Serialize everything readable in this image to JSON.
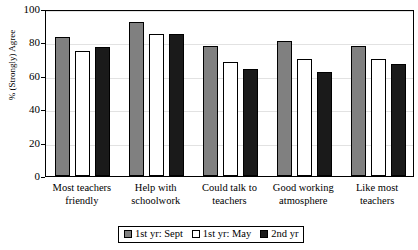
{
  "chart_data": {
    "type": "bar",
    "title": "",
    "xlabel": "",
    "ylabel": "% (Strongly) Agree",
    "ylim": [
      0,
      100
    ],
    "yticks": [
      0,
      20,
      40,
      60,
      80,
      100
    ],
    "ytick_labels": [
      "0",
      "20",
      "40",
      "60",
      "80",
      "100"
    ],
    "grid": true,
    "legend_position": "bottom",
    "categories": [
      "Most teachers friendly",
      "Help with schoolwork",
      "Could talk to teachers",
      "Good working atmosphere",
      "Like most teachers"
    ],
    "category_lines": [
      [
        "Most teachers",
        "friendly"
      ],
      [
        "Help with",
        "schoolwork"
      ],
      [
        "Could talk to",
        "teachers"
      ],
      [
        "Good working",
        "atmosphere"
      ],
      [
        "Like most",
        "teachers"
      ]
    ],
    "series": [
      {
        "name": "1st yr: Sept",
        "color": "#808080",
        "values": [
          83,
          92,
          78,
          81,
          78
        ]
      },
      {
        "name": "1st yr: May",
        "color": "#ffffff",
        "values": [
          75,
          85,
          68,
          70,
          70
        ]
      },
      {
        "name": "2nd yr",
        "color": "#1a1a1a",
        "values": [
          77,
          85,
          64,
          62,
          67
        ]
      }
    ]
  },
  "legend": {
    "items": [
      {
        "label": "1st yr: Sept",
        "swatch": "s0"
      },
      {
        "label": "1st yr: May",
        "swatch": "s1"
      },
      {
        "label": "2nd yr",
        "swatch": "s2"
      }
    ]
  }
}
